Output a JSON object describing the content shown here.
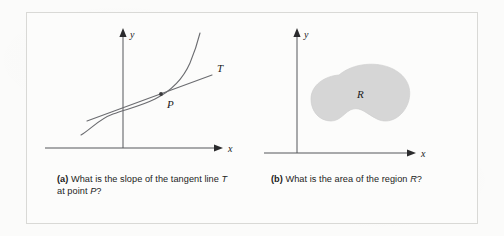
{
  "figure": {
    "panels": [
      {
        "id": "a",
        "caption_marker": "(a)",
        "caption_text": " What is the slope of the tangent line ",
        "caption_italic_1": "T",
        "caption_mid": " at point ",
        "caption_italic_2": "P",
        "caption_end": "?",
        "caption_full": "(a) What is the slope of the tangent line T at point P?",
        "axis_x_label": "x",
        "axis_y_label": "y",
        "tangent_label": "T",
        "point_label": "P",
        "curve_description": "increasing concave-up curve",
        "tangent_description": "straight line touching curve at P"
      },
      {
        "id": "b",
        "caption_marker": "(b)",
        "caption_text": " What is the area of the region ",
        "caption_italic_1": "R",
        "caption_end": "?",
        "caption_full": "(b) What is the area of the region R?",
        "axis_x_label": "x",
        "axis_y_label": "y",
        "region_label": "R",
        "region_description": "shaded kidney-shaped blob"
      }
    ]
  },
  "colors": {
    "page_background": "#fbfbfa",
    "figure_background": "#fcfcfb",
    "frame_border": "#d9d9d6",
    "axis_stroke": "#55565a",
    "curve_stroke": "#6b6c70",
    "region_fill": "#d6d6d6",
    "text": "#1c1c1c"
  }
}
